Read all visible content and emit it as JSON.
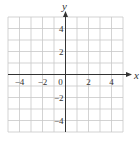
{
  "chart_data": {
    "type": "line",
    "title": "",
    "xlabel": "x",
    "ylabel": "y",
    "xlim": [
      -5,
      5
    ],
    "ylim": [
      -5,
      5
    ],
    "grid": true,
    "grid_step": 1,
    "x_ticks": [
      -4,
      -2,
      0,
      2,
      4
    ],
    "x_tick_labels": [
      "−4",
      "−2",
      "0",
      "2",
      "4"
    ],
    "y_ticks": [
      4,
      2,
      -2,
      -4
    ],
    "y_tick_labels": [
      "4",
      "2",
      "−2",
      "−4"
    ],
    "series": [],
    "legend": null
  },
  "colors": {
    "grid": "#c8c8c8",
    "axis": "#333333",
    "text": "#333333",
    "background": "#ffffff"
  },
  "layout": {
    "grid_left": 8,
    "grid_top": 17,
    "cell": 11.5,
    "cells": 10
  }
}
